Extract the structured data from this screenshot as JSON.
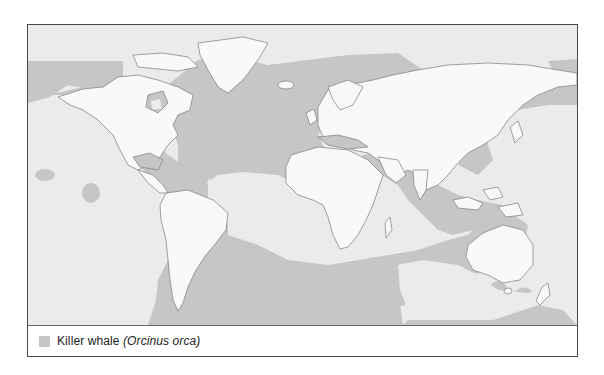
{
  "map": {
    "type": "species-range-world-map",
    "projection": "world (Pacific-split, Americas left)",
    "colors": {
      "ocean_outside_range": "#ebebeb",
      "range_fill": "#c6c6c6",
      "land": "#f9f9f9",
      "coastline": "#7a7a7a",
      "frame": "#4a4a4a"
    }
  },
  "legend": {
    "items": [
      {
        "common_name": "Killer whale",
        "scientific_name": "(Orcinus orca)",
        "swatch_color": "#c6c6c6"
      }
    ]
  }
}
